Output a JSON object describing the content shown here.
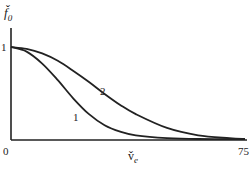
{
  "chart_data": {
    "type": "line",
    "title": "",
    "xlabel": "v̌e",
    "ylabel": "f̌0",
    "x_ticks": [
      "0",
      "75"
    ],
    "y_ticks": [
      "1"
    ],
    "xlim": [
      0,
      75
    ],
    "ylim": [
      0,
      1
    ],
    "grid": false,
    "series": [
      {
        "name": "1",
        "x": [
          0,
          5,
          10,
          15,
          20,
          25,
          30,
          35,
          40,
          50,
          60,
          75
        ],
        "values": [
          1.0,
          0.95,
          0.82,
          0.64,
          0.44,
          0.27,
          0.15,
          0.08,
          0.04,
          0.01,
          0.0,
          0.0
        ]
      },
      {
        "name": "2",
        "x": [
          0,
          5,
          10,
          15,
          20,
          25,
          30,
          35,
          40,
          50,
          60,
          70,
          75
        ],
        "values": [
          1.0,
          0.98,
          0.93,
          0.85,
          0.74,
          0.62,
          0.49,
          0.37,
          0.27,
          0.12,
          0.04,
          0.01,
          0.0
        ]
      }
    ],
    "annotations": [
      "1",
      "2"
    ]
  },
  "labels": {
    "y_axis": "f̌",
    "y_axis_sub": "0",
    "x_axis": "v̌",
    "x_axis_sub": "e",
    "origin": "0",
    "x_max": "75",
    "y_one": "1",
    "curve1": "1",
    "curve2": "2"
  }
}
